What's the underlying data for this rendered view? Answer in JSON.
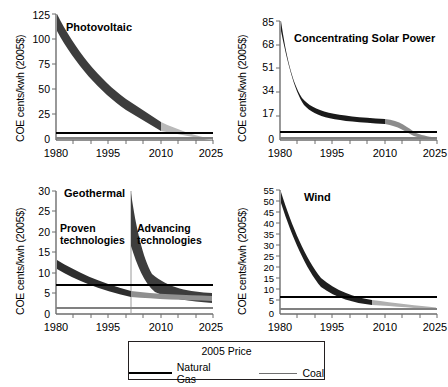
{
  "figure": {
    "background": "#ffffff",
    "axis_color": "#6d6d6d",
    "historical_color": "#3d3d3d",
    "projected_color": "#b9b9b9",
    "natural_gas_color": "#000000",
    "coal_color": "#808080"
  },
  "legend": {
    "title": "2005 Price",
    "entries": [
      {
        "label": "Natural Gas",
        "color": "#000000",
        "style": "solid-dark"
      },
      {
        "label": "Coal",
        "color": "#808080",
        "style": "solid-gray"
      }
    ]
  },
  "charts": [
    {
      "id": "photovoltaic",
      "title": "Photovoltaic",
      "ylabel": "COE cents/kwh (2005$)",
      "yticks": [
        0,
        25,
        50,
        75,
        100,
        125
      ],
      "ylim": [
        0,
        125
      ],
      "xticks": [
        1980,
        1995,
        2010,
        2025
      ],
      "xlim": [
        1980,
        2025
      ],
      "reference_lines": {
        "natural_gas": 7,
        "coal": 2
      },
      "bands": [
        {
          "name": "historical",
          "x": [
            1980,
            1985,
            1990,
            1995,
            2000,
            2006
          ],
          "upper": [
            125,
            92,
            66,
            48,
            36,
            28
          ],
          "lower": [
            108,
            78,
            55,
            39,
            28,
            21
          ]
        },
        {
          "name": "projected",
          "x": [
            2006,
            2011,
            2016,
            2021,
            2025
          ],
          "upper": [
            28,
            21,
            15,
            10,
            7
          ],
          "lower": [
            21,
            15,
            10,
            7,
            5
          ]
        }
      ]
    },
    {
      "id": "concentrating-solar-power",
      "title": "Concentrating Solar Power",
      "ylabel": "COE cents/kwh (2005$)",
      "yticks": [
        0,
        17,
        34,
        51,
        68,
        85
      ],
      "ylim": [
        0,
        85
      ],
      "xticks": [
        1980,
        1995,
        2010,
        2025
      ],
      "xlim": [
        1980,
        2025
      ],
      "reference_lines": {
        "natural_gas": 7,
        "coal": 2
      },
      "bands": [
        {
          "name": "historical",
          "x": [
            1980,
            1983,
            1986,
            1990,
            1995,
            2000,
            2006
          ],
          "upper": [
            85,
            52,
            30,
            22,
            20,
            18,
            16
          ],
          "lower": [
            68,
            38,
            22,
            17,
            15,
            14,
            13
          ]
        },
        {
          "name": "projected",
          "x": [
            2006,
            2010,
            2013,
            2018,
            2025
          ],
          "upper": [
            16,
            11,
            7,
            6,
            6
          ],
          "lower": [
            13,
            8,
            5,
            5,
            4
          ]
        }
      ]
    },
    {
      "id": "geothermal",
      "title": "Geothermal",
      "ylabel": "COE cents/kwh (2005$)",
      "yticks": [
        0,
        5,
        10,
        15,
        20,
        25,
        30
      ],
      "ylim": [
        0,
        30
      ],
      "xticks": [
        1980,
        1995,
        2010,
        2025
      ],
      "xlim": [
        1980,
        2025
      ],
      "reference_lines": {
        "natural_gas": 7,
        "coal": 1.5
      },
      "divider_x": 2006,
      "annotations": [
        {
          "text": "Proven",
          "x": 1983,
          "y": 17.5
        },
        {
          "text": "technologies",
          "x": 1983,
          "y": 15.2
        },
        {
          "text": "Advancing",
          "x": 2009,
          "y": 17.5
        },
        {
          "text": "technologies",
          "x": 2009,
          "y": 15.2
        }
      ],
      "bands": [
        {
          "name": "proven-historical",
          "x": [
            1980,
            1985,
            1990,
            1995,
            2000,
            2006
          ],
          "upper": [
            13.3,
            10.6,
            8.6,
            7.0,
            5.8,
            5.0
          ],
          "lower": [
            11.5,
            9.0,
            7.2,
            5.8,
            4.8,
            4.0
          ]
        },
        {
          "name": "proven-projected",
          "x": [
            2006,
            2012,
            2018,
            2025
          ],
          "upper": [
            5.0,
            4.6,
            4.4,
            4.3
          ],
          "lower": [
            4.0,
            3.6,
            3.4,
            3.3
          ]
        },
        {
          "name": "advancing",
          "x": [
            2006,
            2007,
            2009,
            2012,
            2016,
            2020,
            2025
          ],
          "upper": [
            29.5,
            19.0,
            12.0,
            8.6,
            7.0,
            6.3,
            6.0
          ],
          "lower": [
            6.2,
            5.6,
            5.0,
            4.4,
            4.0,
            3.8,
            3.6
          ]
        }
      ]
    },
    {
      "id": "wind",
      "title": "Wind",
      "ylabel": "COE cents/kwh (2005$)",
      "yticks": [
        0,
        5,
        10,
        15,
        20,
        25,
        30,
        35,
        40,
        45,
        50,
        55
      ],
      "ylim": [
        0,
        55
      ],
      "xticks": [
        1980,
        1995,
        2010,
        2025
      ],
      "xlim": [
        1980,
        2025
      ],
      "reference_lines": {
        "natural_gas": 7.5,
        "coal": 2
      },
      "bands": [
        {
          "name": "historical",
          "x": [
            1980,
            1984,
            1988,
            1992,
            1995,
            2000,
            2006
          ],
          "upper": [
            52,
            33,
            20,
            12,
            8.5,
            5.5,
            4.2
          ],
          "lower": [
            45,
            28,
            16,
            9.5,
            6.8,
            4.2,
            3.2
          ]
        },
        {
          "name": "projected",
          "x": [
            2006,
            2012,
            2018,
            2025
          ],
          "upper": [
            4.2,
            3.6,
            3.0,
            2.6
          ],
          "lower": [
            3.2,
            2.6,
            2.2,
            1.9
          ]
        }
      ]
    }
  ]
}
